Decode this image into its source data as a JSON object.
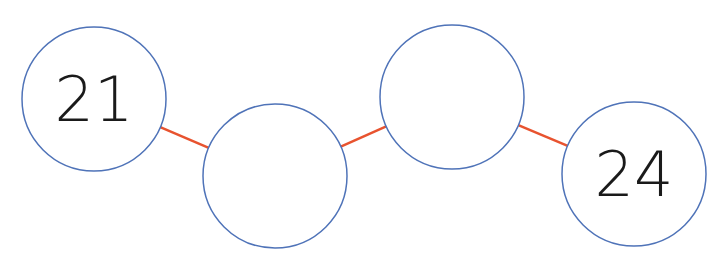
{
  "diagram": {
    "type": "number-chain",
    "colors": {
      "circle_stroke": "#4f73b8",
      "connector": "#e8532f",
      "text": "#1a1a1a",
      "background": "#ffffff"
    },
    "nodes": [
      {
        "id": "n1",
        "label": "21",
        "cx": 94,
        "cy": 99,
        "r": 72
      },
      {
        "id": "n2",
        "label": "",
        "cx": 275,
        "cy": 176,
        "r": 72
      },
      {
        "id": "n3",
        "label": "",
        "cx": 452,
        "cy": 97,
        "r": 72
      },
      {
        "id": "n4",
        "label": "24",
        "cx": 634,
        "cy": 174,
        "r": 72
      }
    ],
    "edges": [
      {
        "from": "n1",
        "to": "n2"
      },
      {
        "from": "n2",
        "to": "n3"
      },
      {
        "from": "n3",
        "to": "n4"
      }
    ]
  }
}
